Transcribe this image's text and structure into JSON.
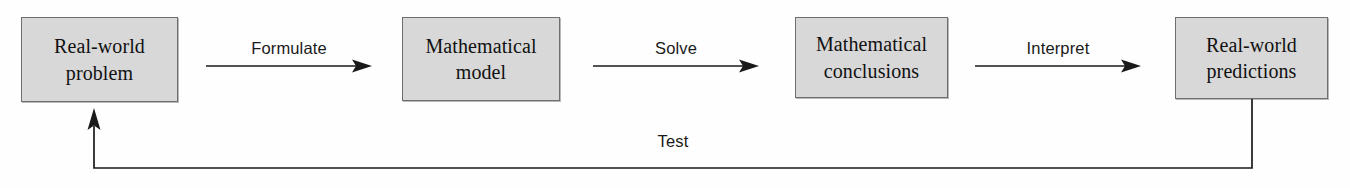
{
  "diagram": {
    "colors": {
      "box_fill": "#d8d8d8",
      "box_border": "#6e6e6e",
      "line": "#1a1a1a",
      "background": "#fefefe"
    },
    "nodes": [
      {
        "id": "real-world-problem",
        "lines": [
          "Real-world",
          "problem"
        ]
      },
      {
        "id": "mathematical-model",
        "lines": [
          "Mathematical",
          "model"
        ]
      },
      {
        "id": "mathematical-conclusions",
        "lines": [
          "Mathematical",
          "conclusions"
        ]
      },
      {
        "id": "real-world-predictions",
        "lines": [
          "Real-world",
          "predictions"
        ]
      }
    ],
    "connectors": [
      {
        "id": "formulate",
        "label": "Formulate",
        "from": "real-world-problem",
        "to": "mathematical-model"
      },
      {
        "id": "solve",
        "label": "Solve",
        "from": "mathematical-model",
        "to": "mathematical-conclusions"
      },
      {
        "id": "interpret",
        "label": "Interpret",
        "from": "mathematical-conclusions",
        "to": "real-world-predictions"
      }
    ],
    "feedback": {
      "id": "test",
      "label": "Test",
      "from": "real-world-predictions",
      "to": "real-world-problem"
    }
  }
}
